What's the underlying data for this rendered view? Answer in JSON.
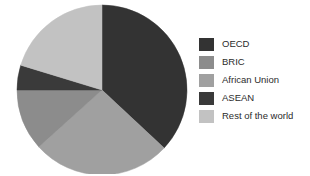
{
  "chart_data": {
    "type": "pie",
    "title": "",
    "categories": [
      "OECD",
      "BRIC",
      "African Union",
      "ASEAN",
      "Rest of the world"
    ],
    "values": [
      37,
      12,
      26,
      5,
      20
    ],
    "units": "percent",
    "start_angle_deg": 0,
    "direction": "clockwise",
    "legend_position": "right",
    "grid": false,
    "colors": [
      "#333333",
      "#8c8c8c",
      "#a0a0a0",
      "#3a3a3a",
      "#c2c2c2"
    ],
    "slices": [
      {
        "label": "OECD",
        "value": 37,
        "color": "#333333",
        "start_deg": 0,
        "end_deg": 133
      },
      {
        "label": "African Union",
        "value": 26,
        "color": "#a0a0a0",
        "start_deg": 133,
        "end_deg": 228
      },
      {
        "label": "BRIC",
        "value": 12,
        "color": "#8c8c8c",
        "start_deg": 228,
        "end_deg": 270
      },
      {
        "label": "ASEAN",
        "value": 5,
        "color": "#3a3a3a",
        "start_deg": 270,
        "end_deg": 287
      },
      {
        "label": "Rest of the world",
        "value": 20,
        "color": "#c2c2c2",
        "start_deg": 287,
        "end_deg": 360
      }
    ]
  },
  "legend": {
    "items": [
      {
        "label": "OECD",
        "color": "#333333"
      },
      {
        "label": "BRIC",
        "color": "#8c8c8c"
      },
      {
        "label": "African Union",
        "color": "#a0a0a0"
      },
      {
        "label": "ASEAN",
        "color": "#3a3a3a"
      },
      {
        "label": "Rest of the world",
        "color": "#c2c2c2"
      }
    ]
  },
  "canvas": {
    "background": "#ffffff",
    "pie_center_x": 88,
    "pie_center_y": 88,
    "pie_radius": 85
  }
}
